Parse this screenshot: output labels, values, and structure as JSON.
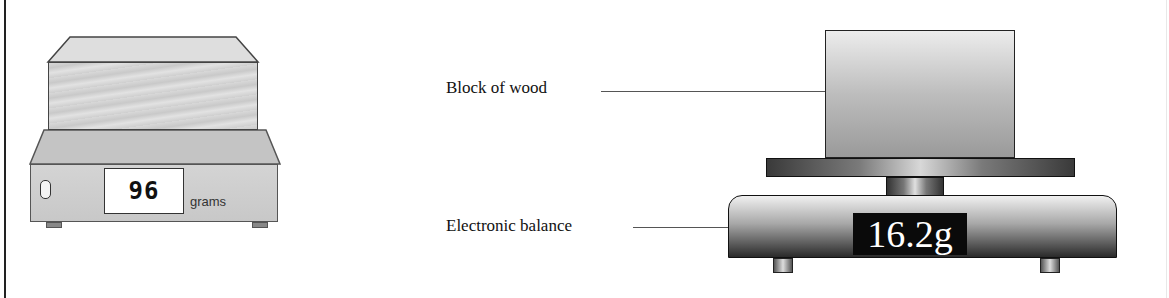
{
  "left_figure": {
    "display_value": "96",
    "unit_label": "grams",
    "colors": {
      "block": "#d4d4d4",
      "base": "#cccccc",
      "display_bg": "#ffffff",
      "outline": "#444444"
    }
  },
  "right_figure": {
    "labels": {
      "block": "Block of wood",
      "balance": "Electronic balance"
    },
    "display_value": "16.2g",
    "colors": {
      "display_bg": "#0a0a0a",
      "display_text": "#ffffff",
      "outline": "#111111"
    }
  }
}
